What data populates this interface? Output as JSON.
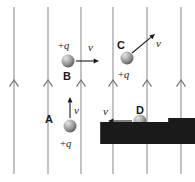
{
  "figure": {
    "background_color": "#ffffff",
    "field": {
      "name": "uniform-field-lines",
      "direction": "up",
      "line_color": "#8e9194",
      "arrowhead_color": "#6f7275",
      "line_count": 6,
      "line_x": [
        14,
        48,
        81,
        113,
        147,
        181
      ],
      "line_top_y": 7,
      "line_bottom_y": 174,
      "arrow_y": 80
    },
    "particle_style": {
      "fill_light": "#d8d8d8",
      "fill_mid": "#9a9a9a",
      "fill_dark": "#5c5c5c",
      "radius": 6.5
    },
    "particles": [
      {
        "id": "A",
        "label": "A",
        "charge_label": "+q",
        "velocity_label": "v",
        "velocity_direction": "up",
        "cx": 70,
        "cy": 126,
        "label_x": 45,
        "label_y": 114,
        "charge_x": 60,
        "charge_y": 139,
        "vel_x": 74,
        "vel_y": 105,
        "arrow": {
          "x1": 70,
          "y1": 118,
          "x2": 70,
          "y2": 97
        }
      },
      {
        "id": "B",
        "label": "B",
        "charge_label": "+q",
        "velocity_label": "v",
        "velocity_direction": "right",
        "cx": 68,
        "cy": 61,
        "label_x": 63,
        "label_y": 71,
        "charge_x": 58,
        "charge_y": 41,
        "vel_x": 88,
        "vel_y": 42,
        "arrow": {
          "x1": 76,
          "y1": 61,
          "x2": 99,
          "y2": 61
        }
      },
      {
        "id": "C",
        "label": "C",
        "charge_label": "+q",
        "velocity_label": "v",
        "velocity_direction": "up-right",
        "cx": 127,
        "cy": 58,
        "label_x": 117,
        "label_y": 40,
        "charge_x": 118,
        "charge_y": 70,
        "vel_x": 156,
        "vel_y": 38,
        "arrow": {
          "x1": 132,
          "y1": 53,
          "x2": 155,
          "y2": 34
        }
      },
      {
        "id": "D",
        "label": "D",
        "charge_label": "+q",
        "velocity_label": "v",
        "velocity_direction": "left",
        "cx": 140,
        "cy": 121,
        "label_x": 136,
        "label_y": 105,
        "charge_x": 130,
        "charge_y": 133,
        "vel_x": 103,
        "vel_y": 106,
        "arrow": {
          "x1": 132,
          "y1": 121,
          "x2": 108,
          "y2": 121
        }
      }
    ]
  }
}
